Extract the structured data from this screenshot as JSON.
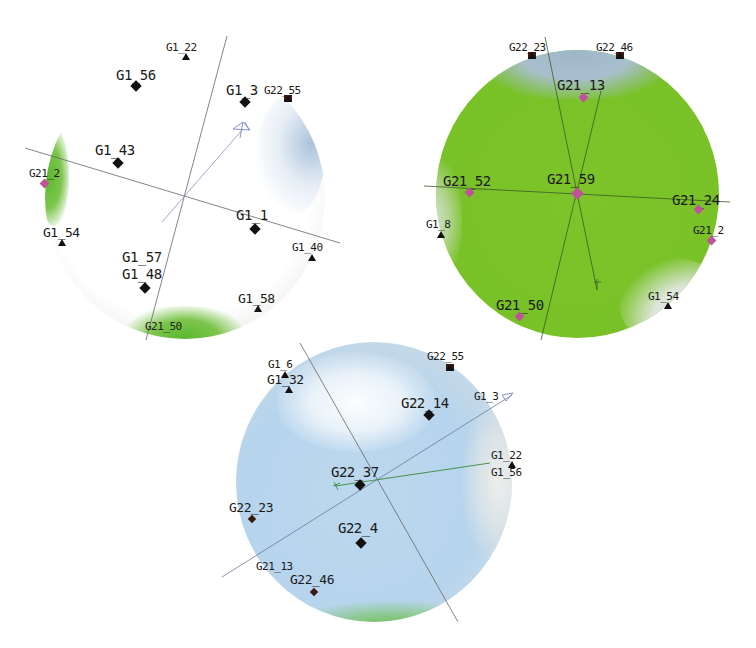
{
  "figure": {
    "panels": [
      {
        "id": "G1",
        "surface_color": "#ffffff",
        "labels": {
          "G1_22": "G1_22",
          "G1_56": "G1_56",
          "G1_3": "G1_3",
          "G22_55": "G22_55",
          "G1_43": "G1_43",
          "G21_2": "G21_2",
          "G1_1": "G1_1",
          "G1_54": "G1_54",
          "G1_40": "G1_40",
          "G1_57": "G1_57",
          "G1_48": "G1_48",
          "G1_58": "G1_58",
          "G21_50": "G21_50"
        }
      },
      {
        "id": "G21",
        "surface_color": "#78c126",
        "labels": {
          "G22_23": "G22_23",
          "G22_46": "G22_46",
          "G21_13": "G21_13",
          "G21_52": "G21_52",
          "G21_59": "G21_59",
          "G21_24": "G21_24",
          "G1_8": "G1_8",
          "G21_2": "G21_2",
          "G21_50": "G21_50",
          "G1_54": "G1_54"
        }
      },
      {
        "id": "G22",
        "surface_color": "#b6d4ec",
        "labels": {
          "G1_6": "G1_6",
          "G1_32": "G1_32",
          "G22_55": "G22_55",
          "G22_14": "G22_14",
          "G1_3": "G1_3",
          "G1_22": "G1_22",
          "G1_56": "G1_56",
          "G22_37": "G22_37",
          "G22_23": "G22_23",
          "G22_4": "G22_4",
          "G21_13": "G21_13",
          "G22_46": "G22_46"
        }
      }
    ],
    "colors": {
      "marker_black": "#111111",
      "marker_pink": "#c0529a",
      "axis_line": "#555555",
      "arrow_blue": "#7a86c8",
      "arrow_green": "#3a8a3a"
    },
    "caption": ""
  }
}
